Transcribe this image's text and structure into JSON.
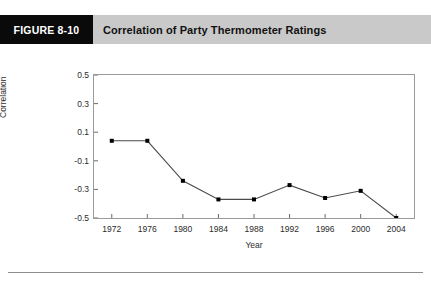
{
  "figure": {
    "number": "FIGURE 8-10",
    "title": "Correlation of Party Thermometer Ratings"
  },
  "colors": {
    "header_band": "#c9c9c9",
    "number_box": "#0a0a0a",
    "number_text": "#ffffff",
    "line": "#4a4a4a",
    "marker": "#000000",
    "frame": "#9a9a9a",
    "axis": "#6b6b6b",
    "rule": "#8d8d8d"
  },
  "chart_data": {
    "type": "line",
    "title": "Correlation of Party Thermometer Ratings",
    "xlabel": "Year",
    "ylabel": "Correlation",
    "x": [
      1972,
      1976,
      1980,
      1984,
      1988,
      1992,
      1996,
      2000,
      2004
    ],
    "categories": [
      "1972",
      "1976",
      "1980",
      "1984",
      "1988",
      "1992",
      "1996",
      "2000",
      "2004"
    ],
    "values": [
      0.04,
      0.04,
      -0.24,
      -0.37,
      -0.37,
      -0.27,
      -0.36,
      -0.31,
      -0.5
    ],
    "series": [
      {
        "name": "Correlation",
        "values": [
          0.04,
          0.04,
          -0.24,
          -0.37,
          -0.37,
          -0.27,
          -0.36,
          -0.31,
          -0.5
        ]
      }
    ],
    "ylim": [
      -0.5,
      0.5
    ],
    "yticks": [
      0.5,
      0.3,
      0.1,
      -0.1,
      -0.3,
      -0.5
    ],
    "ytick_labels": [
      "0.5",
      "0.3",
      "0.1",
      "-0.1",
      "-0.3",
      "-0.5"
    ],
    "xlim": [
      1970,
      2006
    ],
    "xticks": [
      1972,
      1976,
      1980,
      1984,
      1988,
      1992,
      1996,
      2000,
      2004
    ],
    "xtick_labels": [
      "1972",
      "1976",
      "1980",
      "1984",
      "1988",
      "1992",
      "1996",
      "2000",
      "2004"
    ],
    "grid": false,
    "legend": false,
    "marker": "square",
    "marker_size": 4
  }
}
